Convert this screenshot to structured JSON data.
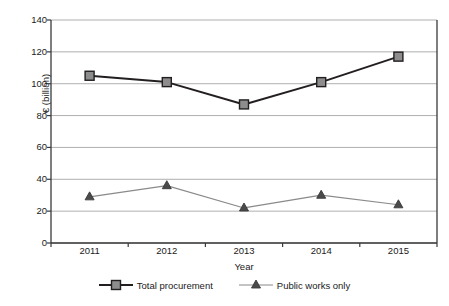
{
  "chart_data": {
    "type": "line",
    "title": "",
    "subtitle": "",
    "xlabel": "Year",
    "ylabel": "€ (billion)",
    "categories": [
      "2011",
      "2012",
      "2013",
      "2014",
      "2015"
    ],
    "x": [
      2011,
      2012,
      2013,
      2014,
      2015
    ],
    "series": [
      {
        "name": "Total procurement",
        "values": [
          105,
          101,
          87,
          101,
          117
        ],
        "marker": "square",
        "line_color": "#231f20",
        "marker_fill": "#8d8d8d",
        "marker_edge": "#231f20"
      },
      {
        "name": "Public works only",
        "values": [
          29,
          36,
          22,
          30,
          24
        ],
        "marker": "triangle",
        "line_color": "#8a8a8a",
        "marker_fill": "#4a4a4a",
        "marker_edge": "#3a3a3a"
      }
    ],
    "ylim": [
      0,
      140
    ],
    "ytick_values": [
      0,
      20,
      40,
      60,
      80,
      100,
      120,
      140
    ],
    "ytick_labels": [
      "0",
      "20",
      "40",
      "60",
      "80",
      "100",
      "120",
      "140"
    ],
    "xtick_labels": [
      "2011",
      "2012",
      "2013",
      "2014",
      "2015"
    ],
    "grid": "horizontal",
    "grid_color": "#9b9b9b",
    "axis_color": "#3a3a3a",
    "legend_position": "bottom",
    "legend_entries": [
      "Total procurement",
      "Public works only"
    ],
    "background_color": "#ffffff"
  }
}
